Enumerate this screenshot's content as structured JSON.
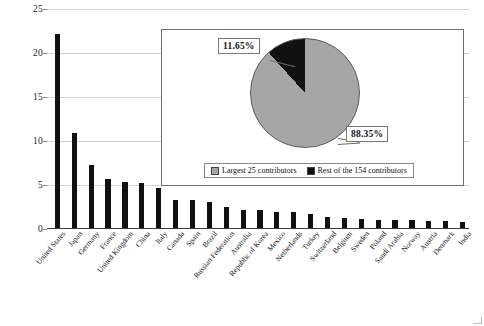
{
  "chart_data": {
    "type": "bar",
    "title": "",
    "xlabel": "",
    "ylabel": "",
    "ylim": [
      0,
      25
    ],
    "yticks": [
      0,
      5,
      10,
      15,
      20,
      25
    ],
    "grid": true,
    "categories": [
      "United States",
      "Japan",
      "Germany",
      "France",
      "United Kingdom",
      "China",
      "Italy",
      "Canada",
      "Spain",
      "Brazil",
      "Russian Federation",
      "Australia",
      "Republic of Korea",
      "Mexico",
      "Netherlands",
      "Turkey",
      "Switzerland",
      "Belgium",
      "Sweden",
      "Poland",
      "Saudi Arabia",
      "Norway",
      "Austria",
      "Denmark",
      "India"
    ],
    "values": [
      22.0,
      10.8,
      7.2,
      5.6,
      5.2,
      5.1,
      4.5,
      3.2,
      3.2,
      2.9,
      2.4,
      2.1,
      2.0,
      1.8,
      1.8,
      1.6,
      1.2,
      1.1,
      1.0,
      0.9,
      0.9,
      0.9,
      0.8,
      0.8,
      0.7
    ],
    "bar_color": "#111111",
    "grid_color": "#d2d2d2",
    "inset": {
      "type": "pie",
      "labels": [
        "Rest of the 154 contributors",
        "Largest 25 contributors"
      ],
      "values": [
        11.65,
        88.35
      ],
      "value_labels": [
        "11.65%",
        "88.35%"
      ],
      "colors": [
        "#111111",
        "#a6a6a6"
      ],
      "legend": {
        "position": "bottom",
        "entries": [
          {
            "label": "Largest 25 contributors",
            "color": "#a6a6a6"
          },
          {
            "label": "Rest of the 154 contributors",
            "color": "#111111"
          }
        ]
      }
    }
  }
}
